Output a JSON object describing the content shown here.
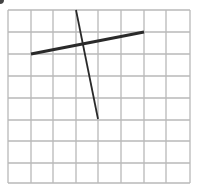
{
  "diagram": {
    "type": "grid-with-line-segments",
    "grid": {
      "columns": 8,
      "rows": 8,
      "x_lines": [
        8,
        31,
        53,
        76,
        98,
        121,
        144,
        166,
        190
      ],
      "y_lines": [
        10,
        32,
        54,
        76,
        98,
        120,
        141,
        163,
        183
      ],
      "line_color": "#b8b8b8"
    },
    "segments": [
      {
        "name": "near-horizontal-segment",
        "x1": 31,
        "y1": 54,
        "x2": 144,
        "y2": 32,
        "color": "#2a2a2a",
        "width": 3,
        "grid_from": [
          1,
          2
        ],
        "grid_to": [
          6,
          1
        ]
      },
      {
        "name": "steep-segment",
        "x1": 76,
        "y1": 10,
        "x2": 98,
        "y2": 119,
        "color": "#2a2a2a",
        "width": 1.8,
        "grid_from": [
          3,
          0
        ],
        "grid_to": [
          4,
          5
        ]
      }
    ]
  }
}
